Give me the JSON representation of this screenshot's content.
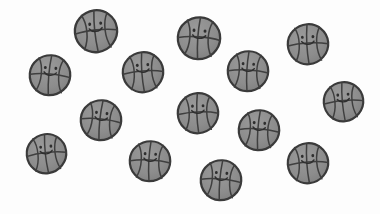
{
  "scene": {
    "title": "Cartoon basketball counting scene",
    "background_color": "#fdfdfd",
    "width": 380,
    "height": 214,
    "object_name": "smiling basketball",
    "object_count": 15,
    "palette": {
      "ball_fill": "#8d8d8d",
      "ball_fill_light": "#9a9a9a",
      "ball_fill_shadow": "#7e7e7e",
      "outline": "#3a3a3a",
      "seam": "#3f3f3f",
      "face": "#2e2e2e"
    },
    "balls": [
      {
        "id": "ball-1",
        "label": "smiling basketball 1",
        "x": 96,
        "y": 31,
        "size": 46,
        "rotation": -6
      },
      {
        "id": "ball-2",
        "label": "smiling basketball 2",
        "x": 199,
        "y": 38,
        "size": 46,
        "rotation": 4
      },
      {
        "id": "ball-3",
        "label": "smiling basketball 3",
        "x": 308,
        "y": 44,
        "size": 44,
        "rotation": -3
      },
      {
        "id": "ball-4",
        "label": "smiling basketball 4",
        "x": 50,
        "y": 75,
        "size": 44,
        "rotation": 5
      },
      {
        "id": "ball-5",
        "label": "smiling basketball 5",
        "x": 143,
        "y": 72,
        "size": 44,
        "rotation": -4
      },
      {
        "id": "ball-6",
        "label": "smiling basketball 6",
        "x": 248,
        "y": 71,
        "size": 44,
        "rotation": 3
      },
      {
        "id": "ball-7",
        "label": "smiling basketball 7",
        "x": 343,
        "y": 101,
        "size": 43,
        "rotation": -5
      },
      {
        "id": "ball-8",
        "label": "smiling basketball 8",
        "x": 101,
        "y": 120,
        "size": 44,
        "rotation": 6
      },
      {
        "id": "ball-9",
        "label": "smiling basketball 9",
        "x": 198,
        "y": 113,
        "size": 44,
        "rotation": -2
      },
      {
        "id": "ball-10",
        "label": "smiling basketball 10",
        "x": 259,
        "y": 130,
        "size": 44,
        "rotation": 4
      },
      {
        "id": "ball-11",
        "label": "smiling basketball 11",
        "x": 46,
        "y": 153,
        "size": 43,
        "rotation": -6
      },
      {
        "id": "ball-12",
        "label": "smiling basketball 12",
        "x": 150,
        "y": 161,
        "size": 44,
        "rotation": 3
      },
      {
        "id": "ball-13",
        "label": "smiling basketball 13",
        "x": 308,
        "y": 163,
        "size": 44,
        "rotation": -4
      },
      {
        "id": "ball-14",
        "label": "smiling basketball 14",
        "x": 221,
        "y": 180,
        "size": 44,
        "rotation": 5
      },
      {
        "id": "ball-15",
        "label": "smiling basketball 15",
        "x": 343,
        "y": 12,
        "size": 0,
        "rotation": 0
      }
    ]
  }
}
